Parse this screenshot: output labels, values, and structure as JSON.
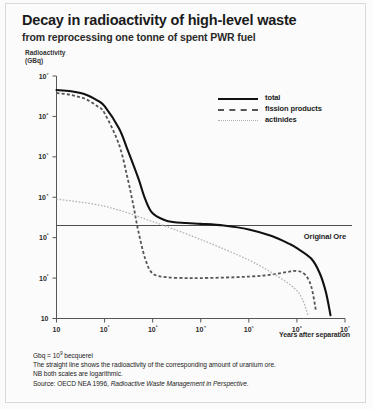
{
  "title": "Decay in radioactivity of high-level waste",
  "subtitle": "from reprocessing one tonne of spent PWR fuel",
  "y_axis_caption_line1": "Radioactivity",
  "y_axis_caption_line2": "(GBq)",
  "ore_label": "Original Ore",
  "x_axis_label": "Years after separation",
  "legend": {
    "items": [
      {
        "label": "total",
        "style": "solid",
        "color": "#111111"
      },
      {
        "label": "fission products",
        "style": "dashed",
        "color": "#555555"
      },
      {
        "label": "actinides",
        "style": "dotted",
        "color": "#b0b0b0"
      }
    ]
  },
  "notes": {
    "line1_prefix": "Gbq = 10",
    "line1_exp": "9",
    "line1_suffix": " becquerel",
    "line2": "The straight line shows the radioactivity of the corresponding amount of uranium ore.",
    "line3": "NB both scales are logarithmic.",
    "line4_prefix": "Source: OECD NEA 1996, ",
    "line4_italic": "Radioactive Waste Management in Perspective."
  },
  "chart_data": {
    "type": "line",
    "title": "Decay in radioactivity of high-level waste",
    "subtitle": "from reprocessing one tonne of spent PWR fuel",
    "xlabel": "Years after separation",
    "ylabel": "Radioactivity (GBq)",
    "xscale": "log",
    "yscale": "log",
    "xlim": [
      10,
      10000000
    ],
    "ylim": [
      10,
      10000000
    ],
    "grid": false,
    "legend_position": "top-right",
    "x_ticks": [
      10,
      100,
      1000,
      10000,
      100000,
      1000000,
      10000000
    ],
    "x_tick_labels": [
      "10",
      "10²",
      "10³",
      "10⁴",
      "10⁵",
      "10⁶",
      "10⁷"
    ],
    "y_ticks": [
      10,
      100,
      1000,
      10000,
      100000,
      1000000,
      10000000
    ],
    "y_tick_labels": [
      "10",
      "10²",
      "10³",
      "10⁴",
      "10⁵",
      "10⁶",
      "10⁷"
    ],
    "annotations": [
      {
        "type": "hline",
        "label": "Original Ore",
        "y": 2000,
        "color": "#4d4d4d"
      }
    ],
    "series": [
      {
        "name": "total",
        "style": "solid",
        "color": "#111111",
        "x": [
          10,
          20,
          40,
          70,
          100,
          200,
          300,
          500,
          700,
          1000,
          2000,
          5000,
          10000,
          30000,
          100000,
          300000,
          700000,
          1000000,
          2000000,
          3000000,
          4000000,
          5000000
        ],
        "y": [
          4500000,
          4200000,
          3500000,
          2500000,
          1800000,
          500000,
          150000,
          30000,
          9000,
          4000,
          2600,
          2300,
          2200,
          2000,
          1600,
          1100,
          700,
          550,
          300,
          130,
          45,
          12
        ]
      },
      {
        "name": "fission products",
        "style": "dashed",
        "color": "#555555",
        "x": [
          10,
          20,
          40,
          70,
          100,
          200,
          300,
          400,
          500,
          700,
          1000,
          2000,
          5000,
          10000,
          50000,
          200000,
          600000,
          1000000,
          1500000,
          2000000,
          2500000
        ],
        "y": [
          3800000,
          3400000,
          2700000,
          1800000,
          1200000,
          200000,
          30000,
          6000,
          1500,
          300,
          130,
          105,
          100,
          100,
          105,
          115,
          140,
          150,
          120,
          60,
          15
        ]
      },
      {
        "name": "actinides",
        "style": "dotted",
        "color": "#b0b0b0",
        "x": [
          10,
          100,
          1000,
          10000,
          100000,
          400000,
          900000,
          1300000,
          1700000
        ],
        "y": [
          9000,
          6000,
          2500,
          900,
          280,
          110,
          55,
          30,
          12
        ]
      }
    ]
  }
}
